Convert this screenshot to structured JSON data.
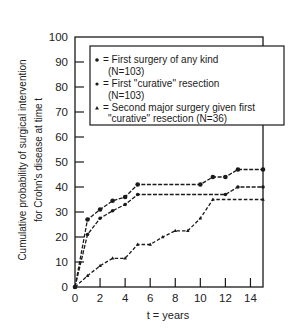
{
  "chart_data": {
    "type": "line",
    "title": "",
    "xlabel": "t = years",
    "ylabel": [
      "Cumulative probability of surgical intervention",
      "for Crohn's disease at time t"
    ],
    "xlim": [
      0,
      15
    ],
    "ylim": [
      0,
      100
    ],
    "xticks": [
      0,
      2,
      4,
      6,
      8,
      10,
      12,
      14
    ],
    "yticks": [
      0,
      10,
      20,
      30,
      40,
      50,
      60,
      70,
      80,
      90,
      100
    ],
    "grid": false,
    "legend_position": "upper-left inside, extending past right frame",
    "series": [
      {
        "name": "First surgery of any kind (N=103)",
        "marker": "large-dot",
        "line": "dashed",
        "x": [
          0,
          1,
          2,
          3,
          4,
          5,
          10,
          11,
          12,
          13,
          15
        ],
        "values": [
          0,
          27,
          31,
          34.5,
          36,
          41,
          41,
          44,
          44,
          47,
          47
        ]
      },
      {
        "name": "First \"curative\" resection (N=103)",
        "marker": "dot",
        "line": "dashed",
        "x": [
          0,
          1,
          2,
          3,
          4,
          5,
          12,
          13,
          15
        ],
        "values": [
          0,
          21,
          27.5,
          30.5,
          33,
          37,
          37,
          40,
          40
        ]
      },
      {
        "name": "Second major surgery given first \"curative\" resection (N=36)",
        "marker": "triangle",
        "line": "dashed",
        "x": [
          0,
          1,
          2,
          3,
          4,
          5,
          6,
          7,
          8,
          9,
          10,
          11,
          15
        ],
        "values": [
          0,
          4.5,
          8.5,
          11.5,
          11.5,
          17,
          17,
          20,
          22.5,
          22.5,
          27.5,
          35,
          35
        ]
      }
    ]
  },
  "legend": {
    "entries": [
      {
        "symbol": "•",
        "line1": "= First surgery of any kind",
        "line2": "(N=103)"
      },
      {
        "symbol": "•",
        "line1": "= First \"curative\" resection",
        "line2": "(N=103)"
      },
      {
        "symbol": "▴",
        "line1": "= Second major surgery given first",
        "line2": "\"curative\" resection (N=36)"
      }
    ]
  },
  "axes": {
    "x_title": "t = years",
    "y_title_line1": "Cumulative probability of surgical intervention",
    "y_title_line2": "for Crohn's disease at time t"
  }
}
